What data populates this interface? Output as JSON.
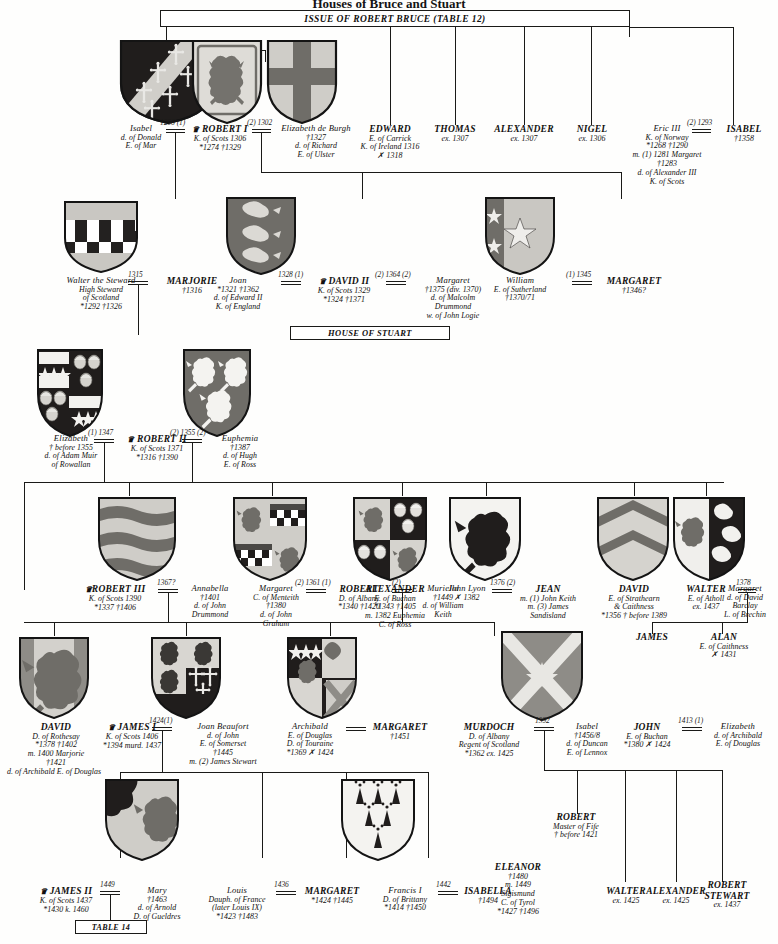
{
  "page": {
    "title": "Houses of Bruce and Stuart",
    "header_band": "ISSUE OF ROBERT BRUCE (TABLE 12)",
    "house_stuart_band": "HOUSE OF STUART",
    "table14_band": "TABLE 14"
  },
  "generation1": [
    {
      "id": "isabel-mar",
      "name": "Isabel",
      "lines": [
        "d. of Donald",
        "E. of Mar"
      ],
      "style": "small"
    },
    {
      "id": "robert-i",
      "name": "ROBERT I",
      "crown": true,
      "lines": [
        "K. of Scots 1306",
        "*1274   †1329"
      ],
      "style": "big"
    },
    {
      "id": "elizabeth-de-burgh",
      "name": "Elizabeth de Burgh",
      "lines": [
        "†1327",
        "d. of Richard",
        "E. of Ulster"
      ],
      "style": "small"
    },
    {
      "id": "edward-carrick",
      "name": "EDWARD",
      "lines": [
        "E. of Carrick",
        "K. of Ireland 1316",
        "✗ 1318"
      ],
      "style": "big"
    },
    {
      "id": "thomas",
      "name": "THOMAS",
      "lines": [
        "ex. 1307"
      ],
      "style": "big"
    },
    {
      "id": "alexander",
      "name": "ALEXANDER",
      "lines": [
        "ex. 1307"
      ],
      "style": "big"
    },
    {
      "id": "nigel",
      "name": "NIGEL",
      "lines": [
        "ex. 1306"
      ],
      "style": "big"
    },
    {
      "id": "eric-iii",
      "name": "Eric III",
      "lines": [
        "K. of Norway",
        "*1268    †1290",
        "m. (1) 1281 Margaret",
        "†1283",
        "d. of Alexander III",
        "K. of Scots"
      ],
      "style": "small"
    },
    {
      "id": "isabel-norway",
      "name": "ISABEL",
      "lines": [
        "†1358"
      ],
      "style": "big"
    }
  ],
  "generation2": [
    {
      "id": "walter-steward",
      "name": "Walter the Steward",
      "lines": [
        "High Steward",
        "of Scotland",
        "*1292    †1326"
      ],
      "style": "small"
    },
    {
      "id": "marjorie",
      "name": "MARJORIE",
      "lines": [
        "†1316"
      ],
      "style": "big"
    },
    {
      "id": "joan",
      "name": "Joan",
      "lines": [
        "*1321    †1362",
        "d. of Edward II",
        "K. of England"
      ],
      "style": "small"
    },
    {
      "id": "david-ii",
      "name": "DAVID II",
      "crown": true,
      "lines": [
        "K. of Scots 1329",
        "*1324    †1371"
      ],
      "style": "big"
    },
    {
      "id": "margaret-drummond",
      "name": "Margaret",
      "lines": [
        "†1375 (div. 1370)",
        "d. of Malcolm",
        "Drummond",
        "w. of John Logie"
      ],
      "style": "small"
    },
    {
      "id": "william-sutherland",
      "name": "William",
      "lines": [
        "E. of Sutherland",
        "†1370/71"
      ],
      "style": "small"
    },
    {
      "id": "margaret-sutherland",
      "name": "MARGARET",
      "lines": [
        "†1346?"
      ],
      "style": "big"
    }
  ],
  "generation3": [
    {
      "id": "elizabeth-mure",
      "name": "Elizabeth",
      "lines": [
        "† before 1355",
        "d. of Adam Muir",
        "of Rowallan"
      ],
      "style": "small"
    },
    {
      "id": "robert-ii",
      "name": "ROBERT II",
      "crown": true,
      "lines": [
        "K. of Scots 1371",
        "*1316    †1390"
      ],
      "style": "big"
    },
    {
      "id": "euphemia-ross",
      "name": "Euphemia",
      "lines": [
        "†1387",
        "d. of Hugh",
        "E. of Ross"
      ],
      "style": "small"
    }
  ],
  "generation4": [
    {
      "id": "robert-iii",
      "name": "ROBERT III",
      "crown": true,
      "lines": [
        "K. of Scots 1390",
        "*1337    †1406"
      ],
      "style": "big"
    },
    {
      "id": "annabella-drummond",
      "name": "Annabella",
      "lines": [
        "†1401",
        "d. of John",
        "Drummond"
      ],
      "style": "small"
    },
    {
      "id": "margaret-menteith",
      "name": "Margaret",
      "lines": [
        "C. of Menteith",
        "†1380",
        "d. of John",
        "Graham"
      ],
      "style": "small"
    },
    {
      "id": "robert-albany",
      "name": "ROBERT",
      "lines": [
        "D. of Albany",
        "*1340    †1420"
      ],
      "style": "big"
    },
    {
      "id": "muriella-keith",
      "name": "Muriella",
      "lines": [
        "†1449",
        "d. of William",
        "Keith"
      ],
      "style": "small"
    },
    {
      "id": "alexander-buchan",
      "name": "ALEXANDER",
      "lines": [
        "E. of Buchan",
        "*1343    †1405",
        "m. 1382 Euphemia",
        "C. of Ross"
      ],
      "style": "big"
    },
    {
      "id": "john-lyon",
      "name": "John Lyon",
      "lines": [
        "✗ 1382"
      ],
      "style": "small"
    },
    {
      "id": "jean",
      "name": "JEAN",
      "lines": [
        "m. (1) John Keith",
        "m. (3) James",
        "Sandisland"
      ],
      "style": "big"
    },
    {
      "id": "david-strathearn",
      "name": "DAVID",
      "lines": [
        "E. of Strathearn",
        "& Caithness",
        "*1356    † before 1389"
      ],
      "style": "big"
    },
    {
      "id": "walter-atholl",
      "name": "WALTER",
      "lines": [
        "E. of Atholl",
        "ex. 1437"
      ],
      "style": "big"
    },
    {
      "id": "margaret-barclay",
      "name": "Margaret",
      "lines": [
        "d. of David",
        "Barclay",
        "L. of Brechin"
      ],
      "style": "small"
    },
    {
      "id": "james-son",
      "name": "JAMES",
      "lines": [],
      "style": "big"
    },
    {
      "id": "alan",
      "name": "ALAN",
      "lines": [
        "E. of Caithness",
        "✗ 1431"
      ],
      "style": "big"
    }
  ],
  "generation5": [
    {
      "id": "david-rothesay",
      "name": "DAVID",
      "lines": [
        "D. of Rothesay",
        "*1378    †1402",
        "m. 1400 Marjorie",
        "†1421",
        "d. of Archibald E. of Douglas"
      ],
      "style": "big"
    },
    {
      "id": "james-i",
      "name": "JAMES I",
      "crown": true,
      "lines": [
        "K. of Scots 1406",
        "*1394 murd. 1437"
      ],
      "style": "big"
    },
    {
      "id": "joan-beaufort",
      "name": "Joan Beaufort",
      "lines": [
        "d. of John",
        "E. of Somerset",
        "†1445",
        "m. (2) James Stewart"
      ],
      "style": "small"
    },
    {
      "id": "archibald-douglas",
      "name": "Archibald",
      "lines": [
        "E. of Douglas",
        "D. of Touraine",
        "*1369    ✗ 1424"
      ],
      "style": "small"
    },
    {
      "id": "margaret-douglas",
      "name": "MARGARET",
      "lines": [
        "†1451"
      ],
      "style": "big"
    },
    {
      "id": "murdoch-albany",
      "name": "MURDOCH",
      "lines": [
        "D. of Albany",
        "Regent of Scotland",
        "*1362    ex. 1425"
      ],
      "style": "big"
    },
    {
      "id": "isabel-lennox",
      "name": "Isabel",
      "lines": [
        "†1456/8",
        "d. of Duncan",
        "E. of Lennox"
      ],
      "style": "small"
    },
    {
      "id": "john-buchan",
      "name": "JOHN",
      "lines": [
        "E. of Buchan",
        "*1380    ✗ 1424"
      ],
      "style": "big"
    },
    {
      "id": "elizabeth-douglas",
      "name": "Elizabeth",
      "lines": [
        "d. of Archibald",
        "E. of Douglas"
      ],
      "style": "small"
    }
  ],
  "generation6": [
    {
      "id": "james-ii",
      "name": "JAMES II",
      "crown": true,
      "lines": [
        "K. of Scots 1437",
        "*1430    k. 1460"
      ],
      "style": "big"
    },
    {
      "id": "mary-gueldres",
      "name": "Mary",
      "lines": [
        "†1463",
        "d. of Arnold",
        "D. of Gueldres"
      ],
      "style": "small"
    },
    {
      "id": "louis-dauphin",
      "name": "Louis",
      "lines": [
        "Dauph. of France",
        "(later Louis IX)",
        "*1423    †1483"
      ],
      "style": "small"
    },
    {
      "id": "margaret-dauphine",
      "name": "MARGARET",
      "lines": [
        "*1424    †1445"
      ],
      "style": "big"
    },
    {
      "id": "francis-i",
      "name": "Francis I",
      "lines": [
        "D. of Brittany",
        "*1414    †1450"
      ],
      "style": "small"
    },
    {
      "id": "isabella",
      "name": "ISABELLA",
      "lines": [
        "†1494"
      ],
      "style": "big"
    },
    {
      "id": "eleanor",
      "name": "ELEANOR",
      "lines": [
        "†1480",
        "m. 1449",
        "Sigismund",
        "C. of Tyrol",
        "*1427    †1496"
      ],
      "style": "big"
    },
    {
      "id": "robert-fife",
      "name": "ROBERT",
      "lines": [
        "Master of Fife",
        "† before 1421"
      ],
      "style": "big"
    },
    {
      "id": "walter-1425",
      "name": "WALTER",
      "lines": [
        "ex. 1425"
      ],
      "style": "big"
    },
    {
      "id": "alexander-1425",
      "name": "ALEXANDER",
      "lines": [
        "ex. 1425"
      ],
      "style": "big"
    },
    {
      "id": "robert-stewart",
      "name": "ROBERT",
      "lines": [
        "STEWART",
        "ex. 1437"
      ],
      "style": "big"
    }
  ],
  "marriages": [
    {
      "id": "m-isabel-robert",
      "date": "1296 (1)"
    },
    {
      "id": "m-robert-elizabeth",
      "date": "(2) 1302"
    },
    {
      "id": "m-eric-isabel",
      "date": "(2) 1293"
    },
    {
      "id": "m-walter-marjorie",
      "date": "1315"
    },
    {
      "id": "m-joan-david",
      "date": "1328 (1)"
    },
    {
      "id": "m-david-margaret",
      "date": "(2) 1364 (2)"
    },
    {
      "id": "m-william-margaret",
      "date": "(1) 1345"
    },
    {
      "id": "m-elizabeth-robertii",
      "date": "(1) 1347"
    },
    {
      "id": "m-robertii-euphemia",
      "date": "(2) 1355 (2)"
    },
    {
      "id": "m-robertiii-annabella",
      "date": "1367?"
    },
    {
      "id": "m-margaret-robert",
      "date": "(2) 1361 (1)"
    },
    {
      "id": "m-robert-muriella",
      "date": "(2)"
    },
    {
      "id": "m-johnlyon-jean",
      "date": "1376 (2)"
    },
    {
      "id": "m-walter-margaret",
      "date": "1378"
    },
    {
      "id": "m-jamesi-joan",
      "date": "1424(1)"
    },
    {
      "id": "m-murdoch-isabel",
      "date": "1392"
    },
    {
      "id": "m-john-elizabeth",
      "date": "1413 (1)"
    },
    {
      "id": "m-jamesii-mary",
      "date": "1449"
    },
    {
      "id": "m-louis-margaret",
      "date": "1436"
    },
    {
      "id": "m-francis-isabella",
      "date": "1442"
    }
  ],
  "shields": [
    {
      "id": "shield-mar",
      "label": "arms-of-mar",
      "field": "#201d1c",
      "accent": "#cfcdc8"
    },
    {
      "id": "shield-scotland-robert-i",
      "label": "royal-arms-of-scotland",
      "field": "#d8d6d1",
      "accent": "#6f6d68"
    },
    {
      "id": "shield-de-burgh",
      "label": "arms-de-burgh",
      "field": "#cfcdc8",
      "accent": "#6f6d68"
    },
    {
      "id": "shield-stewart",
      "label": "arms-of-stewart",
      "field": "#c9c7c2",
      "accent": "#232120"
    },
    {
      "id": "shield-england",
      "label": "royal-arms-of-england",
      "field": "#6f6d68",
      "accent": "#d8d6d1"
    },
    {
      "id": "shield-sutherland",
      "label": "arms-of-sutherland",
      "field": "#c9c7c2",
      "accent": "#5e5c58"
    },
    {
      "id": "shield-mure",
      "label": "arms-of-mure-rowallan",
      "field": "#201d1c",
      "accent": "#f2f1ee"
    },
    {
      "id": "shield-ross",
      "label": "arms-of-ross",
      "field": "#6f6d68",
      "accent": "#f4f3f0"
    },
    {
      "id": "shield-robert-iii",
      "label": "arms-bars-wavy",
      "field": "#cfcdc8",
      "accent": "#6f6d68"
    },
    {
      "id": "shield-albany",
      "label": "arms-of-albany",
      "field": "#cfcdc8",
      "accent": "#6f6d68"
    },
    {
      "id": "shield-buchan",
      "label": "arms-of-buchan",
      "field": "#201d1c",
      "accent": "#cfcdc8"
    },
    {
      "id": "shield-lyon",
      "label": "arms-of-lyon",
      "field": "#f4f3f0",
      "accent": "#201d1c"
    },
    {
      "id": "shield-strathearn",
      "label": "arms-of-strathearn",
      "field": "#c9c7c2",
      "accent": "#5e5c58"
    },
    {
      "id": "shield-atholl",
      "label": "arms-of-atholl",
      "field": "#f0efec",
      "accent": "#201d1c"
    },
    {
      "id": "shield-rothesay",
      "label": "arms-of-rothesay",
      "field": "#cfcdc8",
      "accent": "#6f6d68"
    },
    {
      "id": "shield-james-i",
      "label": "arms-of-james-i",
      "field": "#201d1c",
      "accent": "#f2f1ee"
    },
    {
      "id": "shield-douglas",
      "label": "arms-of-douglas",
      "field": "#201d1c",
      "accent": "#cfcdc8"
    },
    {
      "id": "shield-albany-murdoch",
      "label": "arms-saltire",
      "field": "#8e8c87",
      "accent": "#e8e7e3"
    },
    {
      "id": "shield-gueldres",
      "label": "arms-of-gueldres",
      "field": "#cfcdc8",
      "accent": "#201d1c"
    },
    {
      "id": "shield-brittany",
      "label": "arms-of-brittany-ermine",
      "field": "#f4f3f0",
      "accent": "#201d1c"
    }
  ]
}
